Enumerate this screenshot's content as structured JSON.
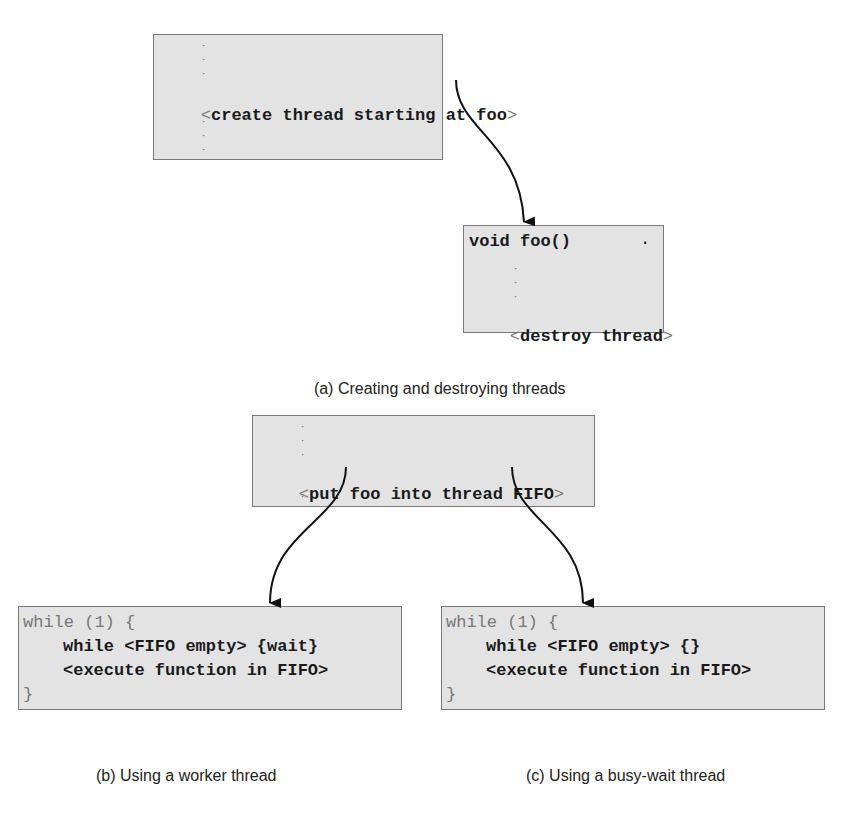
{
  "figure_a": {
    "create_box": {
      "line_lt": "<",
      "line_text": "create thread starting at foo",
      "line_gt": ">"
    },
    "foo_box": {
      "signature": "void foo()",
      "dot": ".",
      "destroy_lt": "<",
      "destroy_text": "destroy thread",
      "destroy_gt": ">"
    },
    "caption_label": "(a)",
    "caption_text": "Creating and destroying threads"
  },
  "figure_bc_source": {
    "line_lt": "<",
    "line_text": "put foo into thread FIFO",
    "line_gt": ">"
  },
  "figure_b": {
    "line1": "while (1) {",
    "line2": "while <FIFO empty> {wait}",
    "line3": "<execute function in FIFO>",
    "line4": "}",
    "caption": "(b) Using a worker thread"
  },
  "figure_c": {
    "line1": "while (1) {",
    "line2": "while <FIFO empty> {}",
    "line3": "<execute function in FIFO>",
    "line4": "}",
    "caption": "(c) Using a busy-wait thread"
  },
  "colors": {
    "box_fill": "#e3e3e3",
    "box_border": "#7a7a7a",
    "arrow": "#111111"
  }
}
